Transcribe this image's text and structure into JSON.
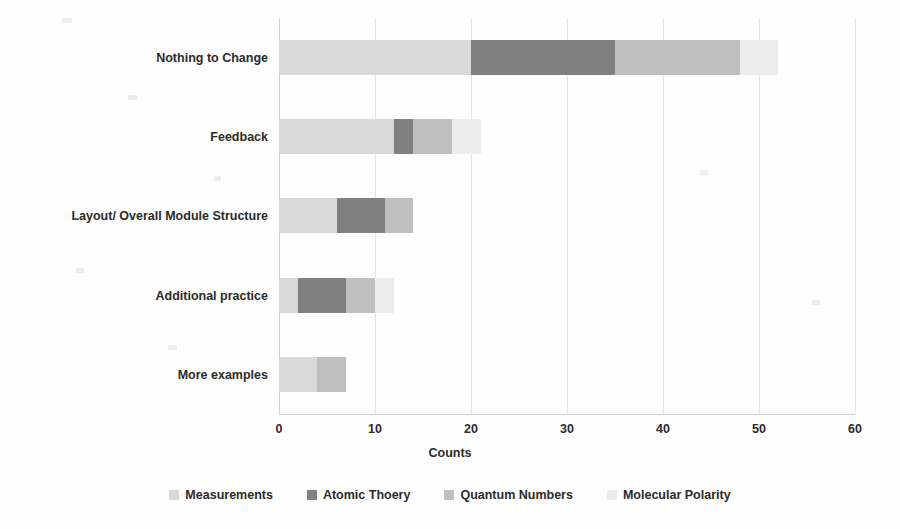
{
  "chart_data": {
    "type": "bar",
    "orientation": "horizontal",
    "stacked": true,
    "title": "",
    "xlabel": "Counts",
    "ylabel": "",
    "xlim": [
      0,
      60
    ],
    "xticks": [
      "0",
      "10",
      "20",
      "30",
      "40",
      "50",
      "60"
    ],
    "grid": true,
    "legend_position": "bottom",
    "categories": [
      "Nothing to Change",
      "Feedback",
      "Layout/ Overall Module Structure",
      "Additional practice",
      "More examples"
    ],
    "series": [
      {
        "name": "Measurements",
        "color": "#d9d9d9",
        "values": [
          20,
          12,
          6,
          2,
          4
        ]
      },
      {
        "name": "Atomic Thoery",
        "color": "#808080",
        "values": [
          15,
          2,
          5,
          5,
          0
        ]
      },
      {
        "name": "Quantum Numbers",
        "color": "#bfbfbf",
        "values": [
          13,
          4,
          3,
          3,
          3
        ]
      },
      {
        "name": "Molecular Polarity",
        "color": "#ececec",
        "values": [
          4,
          3,
          0,
          2,
          0
        ]
      }
    ],
    "totals": [
      52,
      21,
      14,
      12,
      7
    ]
  },
  "axis": {
    "x_title": "Counts",
    "ticks": [
      "0",
      "10",
      "20",
      "30",
      "40",
      "50",
      "60"
    ]
  },
  "legend": {
    "items": [
      {
        "label": "Measurements",
        "color": "#d9d9d9"
      },
      {
        "label": "Atomic Thoery",
        "color": "#808080"
      },
      {
        "label": "Quantum Numbers",
        "color": "#bfbfbf"
      },
      {
        "label": "Molecular Polarity",
        "color": "#ececec"
      }
    ]
  }
}
